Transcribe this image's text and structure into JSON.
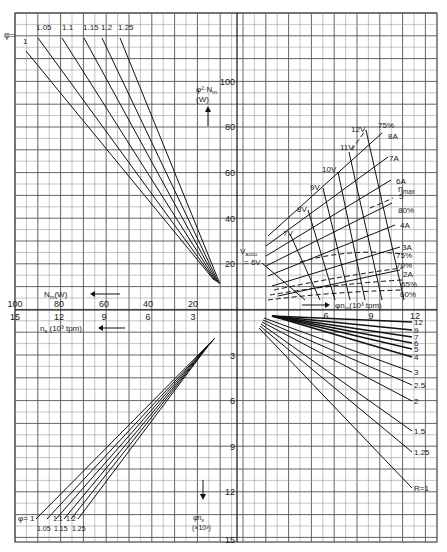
{
  "chart_data": {
    "type": "line",
    "title": "",
    "grid": {
      "on": true,
      "x0": 15,
      "y0": 13,
      "x1": 437,
      "y1": 542,
      "cell": 11.4,
      "major_every": 2,
      "origin_x": 237,
      "origin_y": 310,
      "px_per_unit_power": 2.275,
      "px_per_unit_speed": 15.2
    },
    "quadrants": {
      "top_left": {
        "name": "phi-squared scaling of power",
        "ylabel": "φ²·N_m (W)",
        "xlabel": "N_m (W)",
        "legend_prefix": "φ =",
        "series": [
          {
            "name": "1",
            "label_x": 23,
            "label_y": 44,
            "end_x": 26,
            "end_y": 51
          },
          {
            "name": "1.05",
            "label_x": 36,
            "label_y": 30,
            "end_x": 38,
            "end_y": 38
          },
          {
            "name": "1.1",
            "label_x": 62,
            "label_y": 30,
            "end_x": 62,
            "end_y": 38
          },
          {
            "name": "1.15",
            "label_x": 83,
            "label_y": 30,
            "end_x": 84,
            "end_y": 38
          },
          {
            "name": "1.2",
            "label_x": 101,
            "label_y": 30,
            "end_x": 102,
            "end_y": 38
          },
          {
            "name": "1.25",
            "label_x": 118,
            "label_y": 30,
            "end_x": 120,
            "end_y": 38
          }
        ],
        "converge_x": 219,
        "converge_y": 286
      },
      "top_right": {
        "name": "motor operating map",
        "xlabel": "φ·n_m (10³ tpm)",
        "ylabel": "φ²·N_m (W)",
        "voltage_lines": [
          {
            "name": "V_accu = 6V",
            "x1": 262,
            "y1": 263,
            "x2": 305,
            "y2": 300
          },
          {
            "name": "7V",
            "x1": 290,
            "y1": 234,
            "x2": 320,
            "y2": 300
          },
          {
            "name": "8V",
            "x1": 308,
            "y1": 210,
            "x2": 335,
            "y2": 300
          },
          {
            "name": "9V",
            "x1": 323,
            "y1": 188,
            "x2": 350,
            "y2": 300
          },
          {
            "name": "10V",
            "x1": 338,
            "y1": 172,
            "x2": 365,
            "y2": 300
          },
          {
            "name": "11V",
            "x1": 349,
            "y1": 152,
            "x2": 382,
            "y2": 300
          },
          {
            "name": "12V",
            "x1": 366,
            "y1": 130,
            "x2": 404,
            "y2": 300
          }
        ],
        "current_lines": [
          {
            "name": "2A",
            "x1": 278,
            "y1": 296,
            "x2": 400,
            "y2": 270
          },
          {
            "name": "3A",
            "x1": 272,
            "y1": 286,
            "x2": 400,
            "y2": 247
          },
          {
            "name": "4A",
            "x1": 268,
            "y1": 276,
            "x2": 395,
            "y2": 225
          },
          {
            "name": "5A",
            "x1": 266,
            "y1": 266,
            "x2": 392,
            "y2": 203
          },
          {
            "name": "6A",
            "x1": 266,
            "y1": 256,
            "x2": 391,
            "y2": 180
          },
          {
            "name": "7A",
            "x1": 266,
            "y1": 246,
            "x2": 388,
            "y2": 157
          },
          {
            "name": "8A",
            "x1": 268,
            "y1": 236,
            "x2": 382,
            "y2": 133
          }
        ],
        "efficiency_curves": [
          {
            "name": "60%"
          },
          {
            "name": "65%"
          },
          {
            "name": "70%"
          },
          {
            "name": "75%"
          },
          {
            "name": "80%"
          },
          {
            "name": "75% (upper)"
          }
        ],
        "annotations": [
          "η_max",
          "V_accu",
          "= 6V"
        ]
      },
      "bottom_right": {
        "name": "gear ratio R",
        "legend_prefix": "R =",
        "series": [
          {
            "name": "12",
            "end_x": 412,
            "end_y": 322
          },
          {
            "name": "9",
            "end_x": 412,
            "end_y": 330
          },
          {
            "name": "7",
            "end_x": 412,
            "end_y": 337
          },
          {
            "name": "6",
            "end_x": 412,
            "end_y": 343
          },
          {
            "name": "5",
            "end_x": 412,
            "end_y": 349
          },
          {
            "name": "4",
            "end_x": 412,
            "end_y": 357
          },
          {
            "name": "3",
            "end_x": 412,
            "end_y": 372
          },
          {
            "name": "2.5",
            "end_x": 412,
            "end_y": 385
          },
          {
            "name": "2",
            "end_x": 412,
            "end_y": 401
          },
          {
            "name": "1.5",
            "end_x": 412,
            "end_y": 431
          },
          {
            "name": "1.25",
            "end_x": 412,
            "end_y": 452
          },
          {
            "name": "R=1",
            "end_x": 412,
            "end_y": 488
          }
        ],
        "origin_x": 264,
        "origin_y": 316
      },
      "bottom_left": {
        "name": "phi scaling of wheel speed",
        "xlabel": "n_s (10³ tpm)",
        "ylabel": "φ·n_s (×10³)",
        "legend_prefix": "φ =",
        "series": [
          {
            "name": "1",
            "end_x": 36,
            "end_y": 519
          },
          {
            "name": "1.05",
            "end_x": 47,
            "end_y": 519
          },
          {
            "name": "1.1",
            "end_x": 56,
            "end_y": 519
          },
          {
            "name": "1.15",
            "end_x": 64,
            "end_y": 519
          },
          {
            "name": "1.2",
            "end_x": 71,
            "end_y": 519
          },
          {
            "name": "1.25",
            "end_x": 78,
            "end_y": 519
          }
        ],
        "converge_x": 215,
        "converge_y": 338
      }
    },
    "axes": {
      "y_top_ticks": [
        {
          "v": "100",
          "y": 82
        },
        {
          "v": "80",
          "y": 127
        },
        {
          "v": "60",
          "y": 173
        },
        {
          "v": "40",
          "y": 219
        },
        {
          "v": "20",
          "y": 264
        }
      ],
      "x_left_ticks_power": [
        {
          "v": "100",
          "x": 15
        },
        {
          "v": "80",
          "x": 59
        },
        {
          "v": "60",
          "x": 104
        },
        {
          "v": "40",
          "x": 148
        },
        {
          "v": "20",
          "x": 193
        }
      ],
      "x_left_ticks_speed": [
        {
          "v": "15",
          "x": 15
        },
        {
          "v": "12",
          "x": 59
        },
        {
          "v": "9",
          "x": 104
        },
        {
          "v": "6",
          "x": 148
        },
        {
          "v": "3",
          "x": 193
        }
      ],
      "x_right_ticks": [
        {
          "v": "6",
          "x": 326
        },
        {
          "v": "9",
          "x": 371
        },
        {
          "v": "12",
          "x": 415
        }
      ],
      "y_bottom_ticks": [
        {
          "v": "3",
          "y": 356
        },
        {
          "v": "6",
          "y": 401
        },
        {
          "v": "9",
          "y": 447
        },
        {
          "v": "12",
          "y": 492
        },
        {
          "v": "15",
          "y": 540
        }
      ]
    },
    "labels": {
      "top_y_axis_1": "φ²·N",
      "top_y_axis_sub": "m",
      "top_y_axis_2": "(W)",
      "left_power_axis": "N",
      "left_power_sub": "m",
      "left_power_unit": "(W)",
      "left_speed_axis": "n",
      "left_speed_sub": "s",
      "left_speed_unit": "(10³ tpm)",
      "right_x_axis": "φn",
      "right_x_sub": "m",
      "right_x_unit": "(10³ tpm)",
      "bottom_y_axis": "φn",
      "bottom_y_sub": "s",
      "bottom_y_unit": "(×10³)",
      "phi_eq": "φ=",
      "vaccu": "V",
      "vaccu_sub": "accu",
      "vaccu_val": "= 6V",
      "eta_max": "η",
      "eta_sub": "max",
      "v_labels": [
        "7V",
        "8V",
        "9V",
        "10V",
        "11V",
        "12V"
      ],
      "a_labels": [
        "8A",
        "7A",
        "6A",
        "5",
        "4A",
        "3A",
        "2A"
      ],
      "eff_labels": [
        "75%",
        "80%",
        "75%",
        "70%",
        "65%",
        "60%"
      ]
    }
  }
}
